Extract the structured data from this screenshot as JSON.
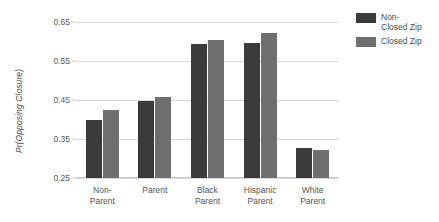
{
  "chart_data": {
    "type": "bar",
    "title": "",
    "xlabel": "",
    "ylabel": "Pr(Opposing Closure)",
    "ylim": [
      0.25,
      0.65
    ],
    "yticks": [
      0.25,
      0.35,
      0.45,
      0.55,
      0.65
    ],
    "ytick_labels": [
      "0.25",
      "0.35",
      "0.45",
      "0.55",
      "0.65"
    ],
    "grid": true,
    "legend_position": "right",
    "categories": [
      "Non-\nParent",
      "Parent",
      "Black\nParent",
      "Hispanic\nParent",
      "White\nParent"
    ],
    "series": [
      {
        "name": "Non-\nClosed Zip",
        "color": "#3b3b3b",
        "values": [
          0.4,
          0.447,
          0.594,
          0.597,
          0.327
        ]
      },
      {
        "name": "Closed Zip",
        "color": "#6f6f6f",
        "values": [
          0.425,
          0.457,
          0.604,
          0.622,
          0.322
        ]
      }
    ]
  },
  "legend": {
    "items": [
      {
        "label": "Non-\nClosed Zip",
        "swatch": "dark"
      },
      {
        "label": "Closed Zip",
        "swatch": "light"
      }
    ]
  },
  "colors": {
    "non_closed_zip": "#3b3b3b",
    "closed_zip": "#6f6f6f",
    "gridline": "#d8d8d8",
    "text": "#555555",
    "background": "#ffffff"
  }
}
